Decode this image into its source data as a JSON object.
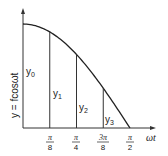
{
  "chart_data": {
    "type": "line",
    "title": "",
    "function": "y = f cos ωt",
    "ylabel": "y = fcosωt",
    "xlabel": "ωt",
    "x_ticks": [
      "π/8",
      "π/4",
      "3π/8",
      "π/2"
    ],
    "x_tick_values": [
      0.3927,
      0.7854,
      1.1781,
      1.5708
    ],
    "xlim": [
      0,
      1.5708
    ],
    "ylim": [
      0,
      1
    ],
    "ordinates": [
      {
        "name": "y0",
        "x": 0
      },
      {
        "name": "y1",
        "x": 0.3927
      },
      {
        "name": "y2",
        "x": 0.7854
      },
      {
        "name": "y3",
        "x": 1.1781
      }
    ],
    "grid": false
  },
  "labels": {
    "y0": {
      "base": "y",
      "sub": "0"
    },
    "y1": {
      "base": "y",
      "sub": "1"
    },
    "y2": {
      "base": "y",
      "sub": "2"
    },
    "y3": {
      "base": "y",
      "sub": "3"
    },
    "tick1": {
      "num": "π",
      "den": "8"
    },
    "tick2": {
      "num": "π",
      "den": "4"
    },
    "tick3": {
      "num": "3π",
      "den": "8"
    },
    "tick4": {
      "num": "π",
      "den": "2"
    },
    "xaxis": "ωt",
    "yaxis": "y = fcosωt"
  }
}
